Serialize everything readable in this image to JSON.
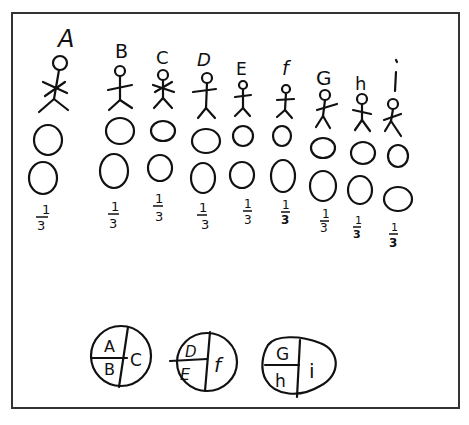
{
  "figures": [
    {
      "label": "A",
      "fraction_num": "1",
      "fraction_den": "3"
    },
    {
      "label": "B",
      "fraction_num": "1",
      "fraction_den": "3"
    },
    {
      "label": "C",
      "fraction_num": "1",
      "fraction_den": "3"
    },
    {
      "label": "D",
      "fraction_num": "1",
      "fraction_den": "3"
    },
    {
      "label": "E",
      "fraction_num": "1",
      "fraction_den": "3"
    },
    {
      "label": "f",
      "fraction_num": "1",
      "fraction_den": "3"
    },
    {
      "label": "G",
      "fraction_num": "1",
      "fraction_den": "3"
    },
    {
      "label": "h",
      "fraction_num": "1",
      "fraction_den": "3"
    },
    {
      "label": "i",
      "fraction_num": "1",
      "fraction_den": "3"
    }
  ],
  "groups": [
    {
      "top_left": "A",
      "bottom_left": "B",
      "right": "C"
    },
    {
      "top_left": "D",
      "bottom_left": "E",
      "right": "f"
    },
    {
      "top_left": "G",
      "bottom_left": "h",
      "right": "i"
    }
  ]
}
